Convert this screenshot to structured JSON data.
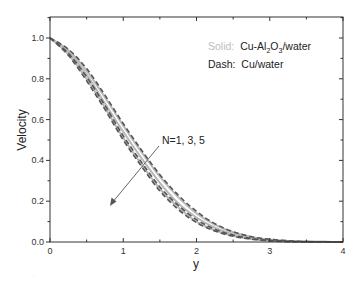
{
  "chart_data": {
    "type": "line",
    "title": "",
    "xlabel": "y",
    "ylabel": "Velocity",
    "xlim": [
      0,
      4
    ],
    "ylim": [
      0,
      1.0
    ],
    "xticks": [
      0,
      1,
      2,
      3,
      4
    ],
    "xtick_labels": [
      "0",
      "1",
      "2",
      "3",
      "4"
    ],
    "yticks": [
      0.0,
      0.2,
      0.4,
      0.6,
      0.8,
      1.0
    ],
    "ytick_labels": [
      "0.0",
      "0.2",
      "0.4",
      "0.6",
      "0.8",
      "1.0"
    ],
    "grid": false,
    "legend": {
      "position": "upper right",
      "entries": [
        {
          "key": "Solid:",
          "label": "Cu-Al2O3/water",
          "label_main": "Cu-Al",
          "sub1": "2",
          "mid": "O",
          "sub2": "3",
          "tail": "/water"
        },
        {
          "key": "Dash:",
          "label": "Cu/water"
        }
      ]
    },
    "annotation": {
      "text": "N=1, 3, 5",
      "arrow": "points toward lower-left, indicating velocity decreases as N increases"
    },
    "x": [
      0,
      0.25,
      0.5,
      0.75,
      1.0,
      1.25,
      1.5,
      1.75,
      2.0,
      2.25,
      2.5,
      2.75,
      3.0,
      3.25,
      3.5,
      3.75,
      4.0
    ],
    "series": [
      {
        "name": "Cu-Al2O3/water N=1",
        "style": "solid",
        "values": [
          1.0,
          0.94,
          0.84,
          0.71,
          0.57,
          0.44,
          0.32,
          0.22,
          0.14,
          0.085,
          0.048,
          0.025,
          0.012,
          0.005,
          0.002,
          0.001,
          0.0
        ]
      },
      {
        "name": "Cu-Al2O3/water N=3",
        "style": "solid",
        "values": [
          1.0,
          0.93,
          0.82,
          0.68,
          0.54,
          0.41,
          0.29,
          0.19,
          0.12,
          0.07,
          0.038,
          0.019,
          0.009,
          0.004,
          0.002,
          0.001,
          0.0
        ]
      },
      {
        "name": "Cu-Al2O3/water N=5",
        "style": "solid",
        "values": [
          1.0,
          0.92,
          0.8,
          0.66,
          0.51,
          0.38,
          0.26,
          0.17,
          0.1,
          0.058,
          0.031,
          0.015,
          0.007,
          0.003,
          0.001,
          0.0,
          0.0
        ]
      },
      {
        "name": "Cu/water N=1",
        "style": "dash",
        "values": [
          1.0,
          0.945,
          0.85,
          0.72,
          0.58,
          0.45,
          0.33,
          0.23,
          0.15,
          0.09,
          0.05,
          0.026,
          0.013,
          0.006,
          0.002,
          0.001,
          0.0
        ]
      },
      {
        "name": "Cu/water N=3",
        "style": "dash",
        "values": [
          1.0,
          0.925,
          0.81,
          0.67,
          0.52,
          0.39,
          0.27,
          0.18,
          0.11,
          0.063,
          0.034,
          0.017,
          0.008,
          0.003,
          0.001,
          0.0,
          0.0
        ]
      },
      {
        "name": "Cu/water N=5",
        "style": "dash",
        "values": [
          1.0,
          0.915,
          0.79,
          0.65,
          0.5,
          0.37,
          0.25,
          0.16,
          0.095,
          0.054,
          0.028,
          0.014,
          0.006,
          0.002,
          0.001,
          0.0,
          0.0
        ]
      }
    ]
  },
  "colors": {
    "axis": "#333333",
    "solid_line": "#b8b8b8",
    "dash_line": "#555555",
    "legend_key_solid": "#bdbdbd",
    "legend_key_dash": "#333333",
    "arrow": "#555555"
  }
}
